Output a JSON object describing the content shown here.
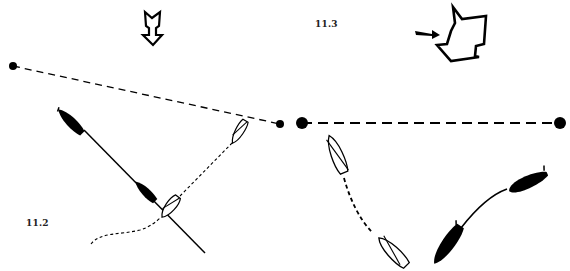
{
  "diagrams": [
    {
      "id": "left",
      "label": "11.2",
      "wind_arrow": "wind-direction-down",
      "line": {
        "style": "dashed",
        "from": [
          13,
          66
        ],
        "to": [
          280,
          124
        ]
      },
      "boats": [
        {
          "fill": "black",
          "role": "leeward-boat-start",
          "tow_line": "solid"
        },
        {
          "fill": "black",
          "role": "leeward-boat-mid"
        },
        {
          "fill": "white",
          "role": "windward-boat-upper"
        },
        {
          "fill": "white",
          "role": "windward-boat-lower"
        }
      ]
    },
    {
      "id": "right",
      "label": "11.3",
      "wind_arrow": "wind-direction-shifted",
      "current_arrow": "pointer-arrow",
      "line": {
        "style": "dashed",
        "from": [
          302,
          123
        ],
        "to": [
          560,
          123
        ]
      },
      "boats": [
        {
          "fill": "white",
          "role": "outline-boat-upper"
        },
        {
          "fill": "white",
          "role": "outline-boat-lower"
        },
        {
          "fill": "black",
          "role": "black-boat-upper"
        },
        {
          "fill": "black",
          "role": "black-boat-lower"
        }
      ]
    }
  ],
  "colors": {
    "ink": "#000000",
    "background": "#ffffff",
    "label": "#222222"
  }
}
